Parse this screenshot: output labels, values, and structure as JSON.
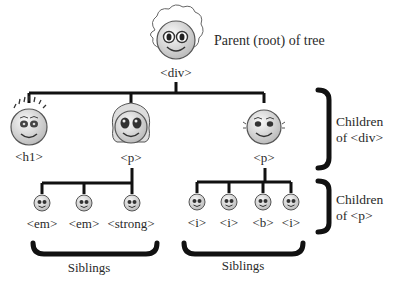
{
  "root": {
    "label": "<div>",
    "caption": "Parent (root) of tree"
  },
  "children_div": [
    {
      "label": "<h1>",
      "face": "spiky-hair-face"
    },
    {
      "label": "<p>",
      "face": "curly-hair-face"
    },
    {
      "label": "<p>",
      "face": "bald-face"
    }
  ],
  "children_p_left": [
    {
      "label": "<em>"
    },
    {
      "label": "<em>"
    },
    {
      "label": "<strong>"
    }
  ],
  "children_p_right": [
    {
      "label": "<i>"
    },
    {
      "label": "<i>"
    },
    {
      "label": "<b>"
    },
    {
      "label": "<i>"
    }
  ],
  "brackets": {
    "children_of_div": {
      "line1": "Children",
      "line2": "of <div>"
    },
    "children_of_p": {
      "line1": "Children",
      "line2": "of <p>"
    },
    "siblings_left": "Siblings",
    "siblings_right": "Siblings"
  },
  "colors": {
    "line": "#111111",
    "face": "#e6e6e6",
    "face_edge": "#555555",
    "text": "#2a2a2a"
  }
}
